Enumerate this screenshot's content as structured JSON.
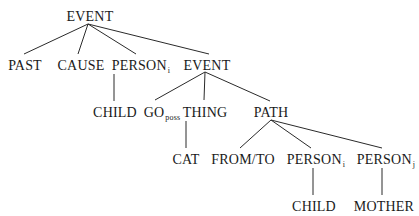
{
  "tree": {
    "root": "EVENT",
    "nodes": [
      {
        "id": "n0",
        "label": "EVENT",
        "sub": "",
        "x": 90,
        "y": 9
      },
      {
        "id": "n1",
        "label": "PAST",
        "sub": "",
        "x": 25,
        "y": 58
      },
      {
        "id": "n2",
        "label": "CAUSE",
        "sub": "",
        "x": 83,
        "y": 58
      },
      {
        "id": "n3",
        "label": "PERSON",
        "sub": "i",
        "x": 145,
        "y": 58
      },
      {
        "id": "n4",
        "label": "EVENT",
        "sub": "",
        "x": 210,
        "y": 58
      },
      {
        "id": "n5",
        "label": "CHILD",
        "sub": "",
        "x": 115,
        "y": 105
      },
      {
        "id": "n6",
        "label": "GO",
        "sub": "poss",
        "x": 164,
        "y": 105
      },
      {
        "id": "n7",
        "label": "THING",
        "sub": "",
        "x": 205,
        "y": 105
      },
      {
        "id": "n8",
        "label": "PATH",
        "sub": "",
        "x": 272,
        "y": 105
      },
      {
        "id": "n9",
        "label": "CAT",
        "sub": "",
        "x": 186,
        "y": 152
      },
      {
        "id": "n10",
        "label": "FROM/TO",
        "sub": "",
        "x": 244,
        "y": 152
      },
      {
        "id": "n11",
        "label": "PERSON",
        "sub": "i",
        "x": 314,
        "y": 152
      },
      {
        "id": "n12",
        "label": "PERSON",
        "sub": "j",
        "x": 385,
        "y": 152
      },
      {
        "id": "n13",
        "label": "CHILD",
        "sub": "",
        "x": 314,
        "y": 199
      },
      {
        "id": "n14",
        "label": "MOTHER",
        "sub": "",
        "x": 385,
        "y": 199
      }
    ],
    "edges": [
      [
        "n0",
        "n1"
      ],
      [
        "n0",
        "n2"
      ],
      [
        "n0",
        "n3"
      ],
      [
        "n0",
        "n4"
      ],
      [
        "n3",
        "n5"
      ],
      [
        "n4",
        "n6"
      ],
      [
        "n4",
        "n7"
      ],
      [
        "n4",
        "n8"
      ],
      [
        "n7",
        "n9"
      ],
      [
        "n8",
        "n10"
      ],
      [
        "n8",
        "n11"
      ],
      [
        "n8",
        "n12"
      ],
      [
        "n11",
        "n13"
      ],
      [
        "n12",
        "n14"
      ]
    ]
  }
}
